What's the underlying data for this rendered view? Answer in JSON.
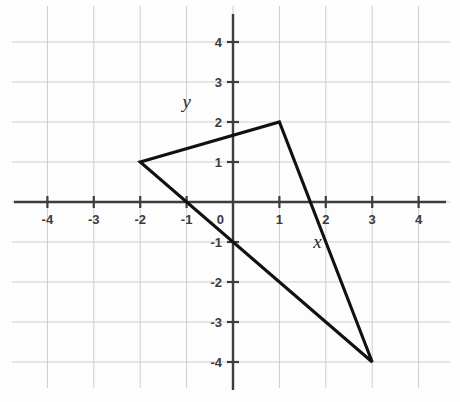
{
  "figure": {
    "background_color": "#fdfdfd",
    "grid_color": "#c9cdd2",
    "axis_color": "#3d3d3d",
    "shape_color": "#111111",
    "x_axis_name": "x",
    "y_axis_name": "y"
  },
  "chart_data": {
    "type": "scatter",
    "title": "",
    "xlabel": "x",
    "ylabel": "y",
    "xlim": [
      -4.6,
      4.6
    ],
    "ylim": [
      -4.7,
      4.7
    ],
    "grid": true,
    "legend": "none",
    "x_ticks": [
      -4,
      -3,
      -2,
      -1,
      0,
      1,
      2,
      3,
      4
    ],
    "y_ticks": [
      4,
      3,
      2,
      1,
      -1,
      -2,
      -3,
      -4
    ],
    "x_tick_labels": [
      "-4",
      "-3",
      "-2",
      "-1",
      "0",
      "1",
      "2",
      "3",
      "4"
    ],
    "y_tick_labels": [
      "4",
      "3",
      "2",
      "1",
      "-1",
      "-2",
      "-3",
      "-4"
    ],
    "series": [
      {
        "name": "triangle",
        "shape": "triangle",
        "closed": true,
        "vertices": [
          {
            "label": "A",
            "x": -2,
            "y": 1
          },
          {
            "label": "B",
            "x": 1,
            "y": 2
          },
          {
            "label": "C",
            "x": 3,
            "y": -4
          }
        ]
      }
    ]
  },
  "axis_name_positions": {
    "x": {
      "x": 1.82,
      "y": -1.15
    },
    "y": {
      "x": -1.0,
      "y": 2.35
    }
  }
}
